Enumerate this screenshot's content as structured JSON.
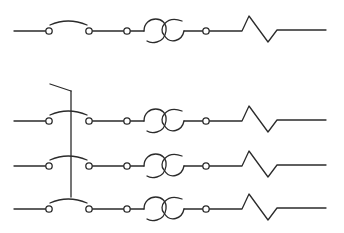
{
  "diagram": {
    "stroke_color": "#2b2b2b",
    "background": "#ffffff",
    "circuits": [
      {
        "id": "single-pole",
        "y": 31,
        "ganged": false
      },
      {
        "id": "three-pole-1",
        "y": 121,
        "ganged": true
      },
      {
        "id": "three-pole-2",
        "y": 166,
        "ganged": true
      },
      {
        "id": "three-pole-3",
        "y": 209,
        "ganged": true
      }
    ],
    "components": [
      "lead-in",
      "switch",
      "terminal",
      "fuse",
      "terminal",
      "resistor",
      "lead-out"
    ],
    "gang_link": {
      "x": 71,
      "y_top": 91,
      "y_bottom": 197,
      "handle_from": [
        50,
        84
      ]
    }
  }
}
